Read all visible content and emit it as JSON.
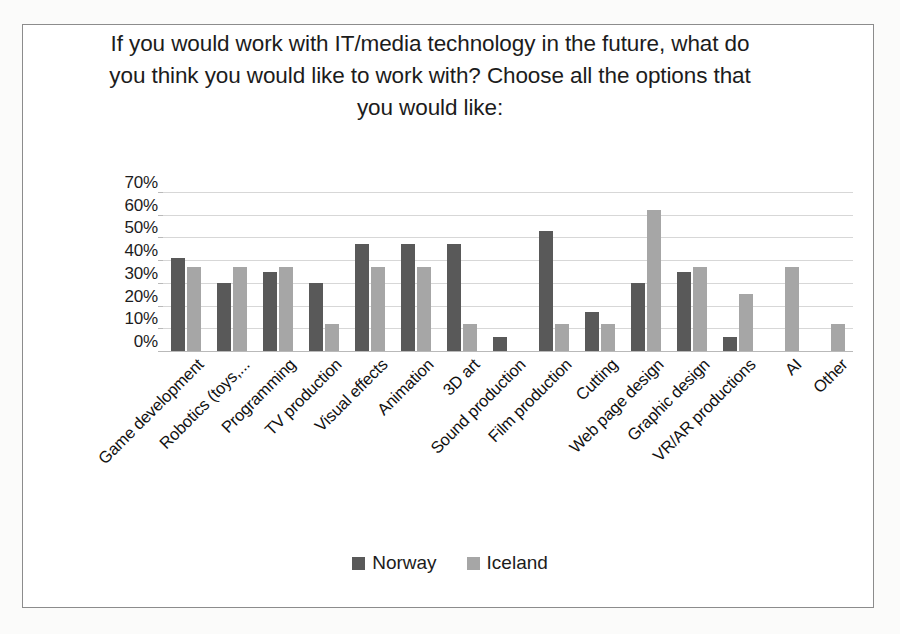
{
  "chart_data": {
    "type": "bar",
    "title": "If you would work with IT/media technology in the future, what do you think you would like to work with? Choose all the options that you would like:",
    "xlabel": "",
    "ylabel": "",
    "ylim": [
      0,
      70
    ],
    "ytick_labels": [
      "70%",
      "60%",
      "50%",
      "40%",
      "30%",
      "20%",
      "10%",
      "0%"
    ],
    "ytick_values": [
      70,
      60,
      50,
      40,
      30,
      20,
      10,
      0
    ],
    "grid": true,
    "legend_position": "bottom",
    "categories": [
      "Game development",
      "Robotics (toys,...",
      "Programming",
      "TV production",
      "Visual effects",
      "Animation",
      "3D art",
      "Sound production",
      "Film production",
      "Cutting",
      "Web page design",
      "Graphic design",
      "VR/AR productions",
      "AI",
      "Other"
    ],
    "series": [
      {
        "name": "Norway",
        "color": "#595959",
        "values": [
          41,
          30,
          35,
          30,
          47,
          47,
          47,
          6,
          53,
          17,
          30,
          35,
          6,
          0,
          0
        ]
      },
      {
        "name": "Iceland",
        "color": "#a6a6a6",
        "values": [
          37,
          37,
          37,
          12,
          37,
          37,
          12,
          0,
          12,
          12,
          62,
          37,
          25,
          37,
          12
        ]
      }
    ]
  }
}
